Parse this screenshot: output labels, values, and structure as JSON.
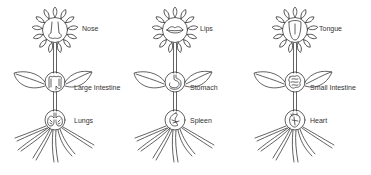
{
  "diagram": {
    "stroke_color": "#3a3a3a",
    "background": "#ffffff",
    "plants": [
      {
        "head": {
          "organ": "Nose",
          "icon": "nose-icon"
        },
        "middle": {
          "organ": "Large Intestine",
          "icon": "large-intestine-icon"
        },
        "bottom": {
          "organ": "Lungs",
          "icon": "lungs-icon"
        }
      },
      {
        "head": {
          "organ": "Lips",
          "icon": "lips-icon"
        },
        "middle": {
          "organ": "Stomach",
          "icon": "stomach-icon"
        },
        "bottom": {
          "organ": "Spleen",
          "icon": "spleen-icon"
        }
      },
      {
        "head": {
          "organ": "Tongue",
          "icon": "tongue-icon"
        },
        "middle": {
          "organ": "Small Intestine",
          "icon": "small-intestine-icon"
        },
        "bottom": {
          "organ": "Heart",
          "icon": "heart-icon"
        }
      }
    ]
  }
}
